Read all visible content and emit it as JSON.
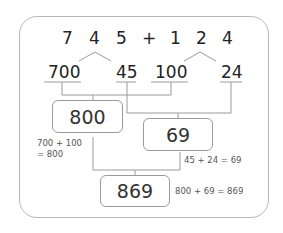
{
  "problem": {
    "digits": [
      "7",
      "4",
      "5",
      "+",
      "1",
      "2",
      "4"
    ]
  },
  "decomposition": {
    "parts": [
      "700",
      "45",
      "100",
      "24"
    ]
  },
  "results": {
    "hundreds_sum": "800",
    "rest_sum": "69",
    "total": "869"
  },
  "notes": {
    "hundreds_line1": "700 + 100",
    "hundreds_line2": "= 800",
    "rest": "45 + 24 = 69",
    "total": "800 + 69 = 869"
  },
  "colors": {
    "line": "#9a9a9a",
    "frame": "#b8b8b8",
    "text": "#222222"
  }
}
